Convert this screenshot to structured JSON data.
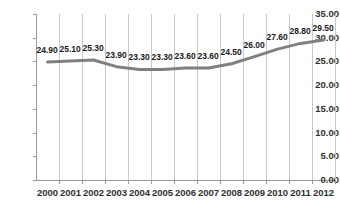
{
  "chart_data": {
    "type": "line",
    "title": "",
    "subtitle": "",
    "xlabel": "",
    "ylabel": "",
    "categories": [
      "2000",
      "2001",
      "2002",
      "2003",
      "2004",
      "2005",
      "2006",
      "2007",
      "2008",
      "2009",
      "2010",
      "2011",
      "2012"
    ],
    "values": [
      24.9,
      25.1,
      25.3,
      23.9,
      23.3,
      23.3,
      23.6,
      23.6,
      24.5,
      26.0,
      27.6,
      28.8,
      29.5
    ],
    "data_labels": [
      "24.90",
      "25.10",
      "25.30",
      "23.90",
      "23.30",
      "23.30",
      "23.60",
      "23.60",
      "24.50",
      "26.00",
      "27.60",
      "28.80",
      "29.50"
    ],
    "ylim": [
      0,
      35
    ],
    "ytick_step": 5,
    "ytick_labels": [
      "35.00",
      "30.00",
      "25.00",
      "20.00",
      "15.00",
      "10.00",
      "5.00",
      "0.00"
    ],
    "ytick_values": [
      35,
      30,
      25,
      20,
      15,
      10,
      5,
      0
    ],
    "grid": {
      "vertical": true,
      "horizontal": false
    },
    "legend": {
      "visible": false,
      "position": "none"
    },
    "series": [
      {
        "name": "series-1",
        "color": "#808080",
        "line_width": 3,
        "markers": false,
        "values": [
          24.9,
          25.1,
          25.3,
          23.9,
          23.3,
          23.3,
          23.6,
          23.6,
          24.5,
          26.0,
          27.6,
          28.8,
          29.5
        ]
      }
    ],
    "colors": {
      "line": "#808080",
      "gridline": "#c9c9c9",
      "axis": "#9a9a9a",
      "tick_text": "#2f2f2f",
      "label_text": "#1a1a1a",
      "background": "#ffffff"
    }
  }
}
